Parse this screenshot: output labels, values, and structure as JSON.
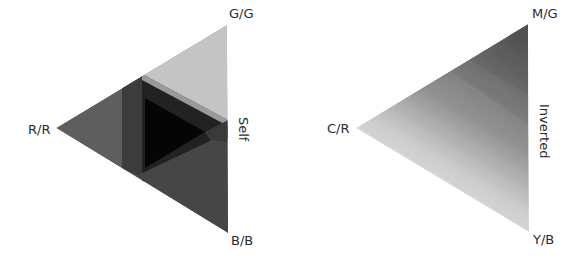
{
  "diagrams": [
    {
      "name": "self",
      "side_label": "Self",
      "vertices": {
        "top": "G/G",
        "left": "R/R",
        "bottom": "B/B"
      },
      "colors": {
        "base": "#5c5c5c",
        "top_band": "#c6c6c6",
        "top_band_mid": "#9c9c9c",
        "overlap": "#3a3a3a",
        "center": "#0c0c0c",
        "bottom_band": "#454545"
      }
    },
    {
      "name": "inverted",
      "side_label": "Inverted",
      "vertices": {
        "top": "M/G",
        "left": "C/R",
        "bottom": "Y/B"
      },
      "colors": {
        "dark": "#5a5a5a",
        "light": "#ececec"
      }
    }
  ]
}
